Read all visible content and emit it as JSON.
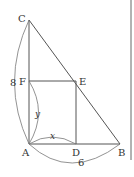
{
  "diagram": {
    "points": {
      "A": {
        "label": "A",
        "x": 29,
        "y": 144
      },
      "B": {
        "label": "B",
        "x": 120,
        "y": 144
      },
      "C": {
        "label": "C",
        "x": 29,
        "y": 20
      },
      "D": {
        "label": "D",
        "x": 76,
        "y": 144
      },
      "E": {
        "label": "E",
        "x": 76,
        "y": 81
      },
      "F": {
        "label": "F",
        "x": 29,
        "y": 81
      }
    },
    "measures": {
      "AC": "8",
      "AB": "6",
      "AD": "x",
      "AF": "y"
    },
    "colors": {
      "line": "#555555",
      "text": "#333333"
    }
  }
}
